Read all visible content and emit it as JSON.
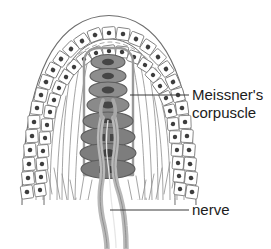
{
  "figure": {
    "background_color": "#ffffff",
    "width": 271,
    "height": 249
  },
  "labels": {
    "corpuscle": {
      "line1": "Meissner's",
      "line2": "corpuscle",
      "color": "#1c1c1c",
      "leader_color": "#3a3a3a"
    },
    "nerve": {
      "text": "nerve",
      "color": "#1c1c1c",
      "leader_color": "#3a3a3a"
    }
  },
  "colors": {
    "outline": "#6e6e6e",
    "epithelial_cell_fill": "#ffffff",
    "epithelial_cell_stroke": "#777777",
    "nucleus_fill": "#3d3d3d",
    "capsule_stroke": "#9a9a9a",
    "lamella_fill_light": "#8d8d8d",
    "lamella_fill_dark": "#7b7b7b",
    "lamella_stroke": "#5c5c5c",
    "lamella_nucleus": "#454545",
    "nerve_fiber_fill": "#b9b9b9",
    "nerve_fiber_stroke": "#8a8a8a",
    "collagen_fiber": "#8e8e8e"
  },
  "structures": {
    "papilla": "dermal papilla dome",
    "epidermis_cells": "stratified epithelial cells with nuclei",
    "capsule": "connective tissue capsule",
    "lamellae": "stacked flattened Schwann cell lamellae",
    "nerve_fiber": "myelinated afferent nerve fiber",
    "collagen": "collagen fiber hatching"
  },
  "geometry": {
    "epithelial_outer_cells": 34,
    "epithelial_inner_cells": 30,
    "lamellae_count": 9
  }
}
